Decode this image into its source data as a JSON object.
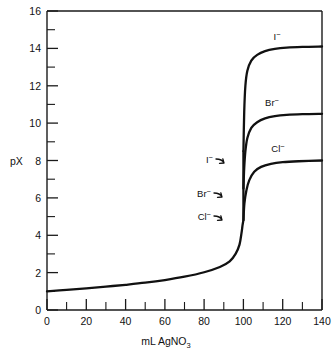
{
  "chart_data": {
    "type": "line",
    "title": "",
    "xlabel": "mL AgNO3",
    "xlabel_main": "mL  AgNO",
    "xlabel_sub": "3",
    "ylabel": "pX",
    "xlim": [
      0,
      140
    ],
    "ylim": [
      0,
      16
    ],
    "x_major_step": 20,
    "x_minor_step": 10,
    "y_major_step": 2,
    "y_minor_step": 1,
    "grid": false,
    "legend_position": "inline-annotations",
    "x_tick_labels": [
      "0",
      "20",
      "40",
      "60",
      "80",
      "100",
      "120",
      "140"
    ],
    "x_tick_values": [
      0,
      20,
      40,
      60,
      80,
      100,
      120,
      140
    ],
    "y_tick_labels": [
      "0",
      "2",
      "4",
      "6",
      "8",
      "10",
      "12",
      "14",
      "16"
    ],
    "y_tick_values": [
      0,
      2,
      4,
      6,
      8,
      10,
      12,
      14,
      16
    ],
    "equivalence_point_ml": 100,
    "common_branch": {
      "name": "shared titration branch",
      "x": [
        0,
        10,
        20,
        30,
        40,
        50,
        60,
        70,
        80,
        88,
        93,
        96,
        98,
        99,
        99.5,
        99.8,
        100
      ],
      "y": [
        1.0,
        1.08,
        1.16,
        1.25,
        1.35,
        1.46,
        1.6,
        1.78,
        2.02,
        2.3,
        2.6,
        3.0,
        3.5,
        4.1,
        4.5,
        4.7,
        4.8
      ]
    },
    "series": [
      {
        "name": "I-",
        "label_main": "I",
        "label_sup": "−",
        "branch_pX": 8.5,
        "plateau_pX": 14.1,
        "x": [
          100,
          100.4,
          101,
          102,
          104,
          107,
          111,
          116,
          122,
          130,
          140
        ],
        "y": [
          8.5,
          10.6,
          12.0,
          12.8,
          13.35,
          13.65,
          13.85,
          13.97,
          14.04,
          14.08,
          14.1
        ],
        "outer_label_x": 118,
        "outer_label_pX": 14.9,
        "inner_label_x": 92,
        "inner_label_pX": 8.1
      },
      {
        "name": "Br-",
        "label_main": "Br",
        "label_sup": "−",
        "branch_pX": 6.5,
        "plateau_pX": 10.5,
        "x": [
          100,
          100.4,
          101,
          102,
          104,
          107,
          111,
          116,
          122,
          130,
          140
        ],
        "y": [
          6.5,
          7.6,
          8.5,
          9.2,
          9.75,
          10.05,
          10.25,
          10.37,
          10.44,
          10.48,
          10.5
        ],
        "outer_label_x": 115,
        "outer_label_pX": 11.3,
        "inner_label_x": 91,
        "inner_label_pX": 6.25
      },
      {
        "name": "Cl-",
        "label_main": "Cl",
        "label_sup": "−",
        "branch_pX": 4.8,
        "plateau_pX": 8.0,
        "x": [
          100,
          100.5,
          101.5,
          103,
          105.5,
          109,
          114,
          120,
          128,
          140
        ],
        "y": [
          4.8,
          5.7,
          6.4,
          6.95,
          7.4,
          7.66,
          7.82,
          7.91,
          7.96,
          8.0
        ],
        "outer_label_x": 118,
        "outer_label_pX": 8.6,
        "inner_label_x": 91,
        "inner_label_pX": 5.0
      }
    ]
  },
  "axis": {
    "y_title": "pX"
  }
}
